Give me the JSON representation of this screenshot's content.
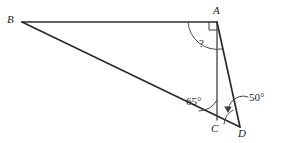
{
  "figure": {
    "type": "geometry-diagram",
    "background_color": "#ffffff",
    "line_color": "#2b2b2b",
    "annotation_color": "#3a3a3a",
    "width": 284,
    "height": 143
  },
  "vertices": [
    {
      "id": "B",
      "label": "B",
      "x": 22,
      "y": 22
    },
    {
      "id": "A",
      "label": "A",
      "x": 217,
      "y": 22
    },
    {
      "id": "C",
      "label": "C",
      "x": 217,
      "y": 120
    },
    {
      "id": "D",
      "label": "D",
      "x": 240,
      "y": 127
    }
  ],
  "segments": [
    {
      "id": "BA",
      "from": "B",
      "to": "A",
      "style": "solid"
    },
    {
      "id": "BD",
      "from": "B",
      "to": "D",
      "style": "solid"
    },
    {
      "id": "AC",
      "from": "A",
      "to": "C",
      "style": "solid"
    },
    {
      "id": "AD",
      "from": "A",
      "to": "D",
      "style": "solid"
    }
  ],
  "angles": [
    {
      "id": "angle-A-right",
      "at": "A",
      "marker": "right-angle-square",
      "value": "",
      "description": "right angle between BA and AC"
    },
    {
      "id": "angle-A-unknown",
      "at": "A",
      "marker": "arc",
      "value": "?",
      "description": "unknown angle between BA and AD"
    },
    {
      "id": "angle-C",
      "at": "C",
      "marker": "arc",
      "value": "65°",
      "description": "angle between CB and CA"
    },
    {
      "id": "angle-D",
      "at": "D",
      "marker": "arc-with-arrow",
      "value": "50°",
      "description": "angle at D between DA and DC"
    }
  ],
  "labels": {
    "B": "B",
    "A": "A",
    "C": "C",
    "D": "D",
    "angle_c": "65°",
    "angle_d": "50°",
    "unknown": "?"
  }
}
